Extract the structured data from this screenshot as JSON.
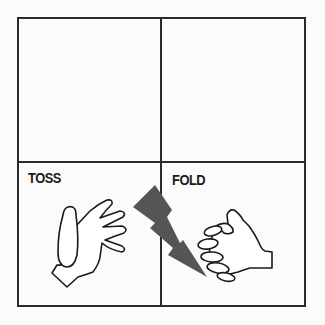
{
  "diagram": {
    "layout": "2x2 grid",
    "cells": [
      {
        "position": "top-left",
        "label": ""
      },
      {
        "position": "top-right",
        "label": ""
      },
      {
        "position": "bottom-left",
        "label": "TOSS",
        "illustration": "open-hand-icon"
      },
      {
        "position": "bottom-right",
        "label": "FOLD",
        "illustration": "folded-fist-icon"
      }
    ],
    "connector": {
      "icon": "lightning-bolt-icon",
      "color": "#555555"
    },
    "colors": {
      "line": "#2a2a2a",
      "background": "#fbfbfa"
    }
  }
}
